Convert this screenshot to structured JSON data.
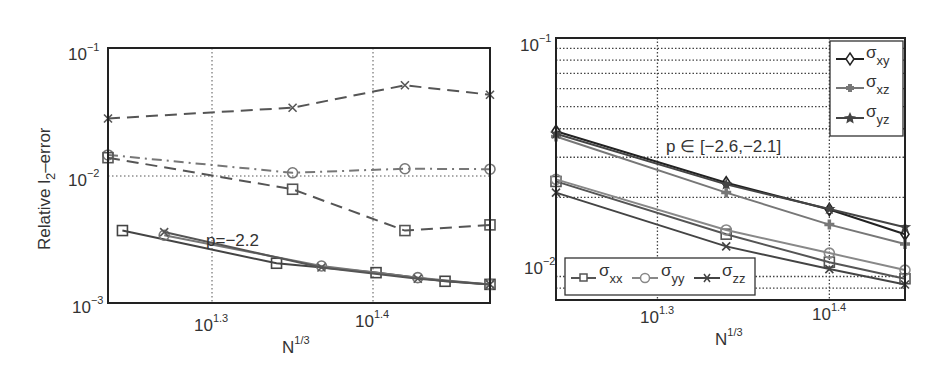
{
  "chart_data": [
    {
      "type": "line",
      "panel": "left",
      "title": "",
      "xlabel": "N^{1/3}",
      "ylabel": "Relative l_2-error",
      "xscale": "log",
      "yscale": "log",
      "xlim_log10": [
        1.235,
        1.473
      ],
      "ylim": [
        0.001,
        0.1
      ],
      "xticks": [
        {
          "label": "10",
          "exp": "1.3",
          "log10": 1.3
        },
        {
          "label": "10",
          "exp": "1.4",
          "log10": 1.4
        }
      ],
      "yticks": [
        {
          "label": "10",
          "exp": "−1",
          "value": 0.1
        },
        {
          "label": "10",
          "exp": "−2",
          "value": 0.01
        },
        {
          "label": "10",
          "exp": "−3",
          "value": 0.001
        }
      ],
      "grid": "x major dotted, y at 10^-2 dotted",
      "annotations": [
        {
          "text": "p=−2.2"
        }
      ],
      "legend": null,
      "series": [
        {
          "name": "dashed-x",
          "style": "dashed",
          "marker": "x",
          "color": "#555555",
          "x_log10": [
            1.235,
            1.35,
            1.42,
            1.473
          ],
          "y": [
            0.028,
            0.034,
            0.051,
            0.043
          ]
        },
        {
          "name": "dashdot-circle",
          "style": "dashdot",
          "marker": "o",
          "color": "#777777",
          "x_log10": [
            1.235,
            1.35,
            1.42,
            1.473
          ],
          "y": [
            0.0145,
            0.0105,
            0.0113,
            0.0112
          ]
        },
        {
          "name": "dashed-square",
          "style": "dashed",
          "marker": "s",
          "color": "#555555",
          "x_log10": [
            1.235,
            1.35,
            1.42,
            1.473
          ],
          "y": [
            0.0138,
            0.0078,
            0.0037,
            0.0041
          ]
        },
        {
          "name": "solid-square",
          "style": "solid",
          "marker": "s",
          "color": "#444444",
          "x_log10": [
            1.244,
            1.34,
            1.402,
            1.445,
            1.473
          ],
          "y": [
            0.0037,
            0.00205,
            0.00173,
            0.00148,
            0.0014
          ]
        },
        {
          "name": "solid-circle",
          "style": "solid",
          "marker": "o",
          "color": "#777777",
          "x_log10": [
            1.27,
            1.368,
            1.428,
            1.473
          ],
          "y": [
            0.0034,
            0.00195,
            0.00158,
            0.0014
          ]
        },
        {
          "name": "solid-x",
          "style": "solid",
          "marker": "x",
          "color": "#555555",
          "x_log10": [
            1.27,
            1.368,
            1.428,
            1.473
          ],
          "y": [
            0.0036,
            0.0019,
            0.00155,
            0.0014
          ]
        }
      ]
    },
    {
      "type": "line",
      "panel": "right",
      "title": "",
      "xlabel": "N^{1/3}",
      "ylabel": "",
      "xscale": "log",
      "yscale": "log",
      "xlim_log10": [
        1.241,
        1.444
      ],
      "ylim": [
        0.0071,
        0.1
      ],
      "xticks": [
        {
          "label": "10",
          "exp": "1.3",
          "log10": 1.3
        },
        {
          "label": "10",
          "exp": "1.4",
          "log10": 1.4
        }
      ],
      "yticks": [
        {
          "label": "10",
          "exp": "−1",
          "value": 0.1
        },
        {
          "label": "10",
          "exp": "−2",
          "value": 0.01
        }
      ],
      "grid": "full minor dotted grid",
      "annotations": [
        {
          "text": "p ∈ [−2.6,−2.1]"
        }
      ],
      "legend": [
        {
          "position": "upper-right",
          "entries": [
            "σxy",
            "σxz",
            "σyz"
          ]
        },
        {
          "position": "lower-left",
          "entries": [
            "σxx",
            "σyy",
            "σzz"
          ]
        }
      ],
      "series": [
        {
          "name": "σxy",
          "marker": "diamond",
          "color": "#222222",
          "x_log10": [
            1.241,
            1.34,
            1.4,
            1.444
          ],
          "y": [
            0.039,
            0.0232,
            0.0177,
            0.0138
          ]
        },
        {
          "name": "σxz",
          "marker": "plus-filled",
          "color": "#777777",
          "x_log10": [
            1.241,
            1.34,
            1.4,
            1.444
          ],
          "y": [
            0.037,
            0.021,
            0.0152,
            0.0125
          ]
        },
        {
          "name": "σyz",
          "marker": "star",
          "color": "#444444",
          "x_log10": [
            1.241,
            1.34,
            1.4,
            1.444
          ],
          "y": [
            0.038,
            0.0228,
            0.0178,
            0.0148
          ]
        },
        {
          "name": "σxx",
          "marker": "square",
          "color": "#555555",
          "x_log10": [
            1.241,
            1.34,
            1.4,
            1.444
          ],
          "y": [
            0.0235,
            0.0138,
            0.0104,
            0.0088
          ]
        },
        {
          "name": "σyy",
          "marker": "circle",
          "color": "#888888",
          "x_log10": [
            1.241,
            1.34,
            1.4,
            1.444
          ],
          "y": [
            0.024,
            0.0144,
            0.0114,
            0.0096
          ]
        },
        {
          "name": "σzz",
          "marker": "x",
          "color": "#444444",
          "x_log10": [
            1.241,
            1.34,
            1.4,
            1.444
          ],
          "y": [
            0.021,
            0.0122,
            0.0097,
            0.0083
          ]
        }
      ]
    }
  ],
  "left": {
    "ylabel_main": "Relative l",
    "ylabel_sub": "2",
    "ylabel_tail": "–error",
    "annotation": "p=−2.2",
    "xlabel_base": "N",
    "xlabel_exp": "1/3",
    "xtick_1_base": "10",
    "xtick_1_exp": "1.3",
    "xtick_2_base": "10",
    "xtick_2_exp": "1.4",
    "ytick_1_base": "10",
    "ytick_1_exp": "−1",
    "ytick_2_base": "10",
    "ytick_2_exp": "−2",
    "ytick_3_base": "10",
    "ytick_3_exp": "−3"
  },
  "right": {
    "annotation": "p ∈ [−2.6,−2.1]",
    "xlabel_base": "N",
    "xlabel_exp": "1/3",
    "xtick_1_base": "10",
    "xtick_1_exp": "1.3",
    "xtick_2_base": "10",
    "xtick_2_exp": "1.4",
    "ytick_1_base": "10",
    "ytick_1_exp": "−1",
    "ytick_2_base": "10",
    "ytick_2_exp": "−2",
    "legend_top": [
      {
        "sym": "σ",
        "sub": "xy"
      },
      {
        "sym": "σ",
        "sub": "xz"
      },
      {
        "sym": "σ",
        "sub": "yz"
      }
    ],
    "legend_bottom": [
      {
        "sym": "σ",
        "sub": "xx"
      },
      {
        "sym": "σ",
        "sub": "yy"
      },
      {
        "sym": "σ",
        "sub": "zz"
      }
    ]
  }
}
